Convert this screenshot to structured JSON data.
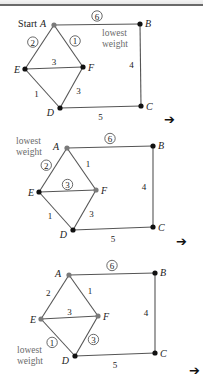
{
  "colors": {
    "edge": "#555555",
    "visited_vertex": "#7a7a7a",
    "unvisited_vertex": "#111111",
    "label_text": "#222222",
    "note_text": "#6a6a6a"
  },
  "panels": [
    {
      "offset_y": 0,
      "note": {
        "line1": "lowest",
        "line2": "weight",
        "x": 102,
        "y": 36
      },
      "start_label": "Start",
      "vertices": {
        "A": {
          "label": "A",
          "x": 54,
          "y": 25,
          "visited": true
        },
        "B": {
          "label": "B",
          "x": 140,
          "y": 24,
          "visited": false
        },
        "C": {
          "label": "C",
          "x": 141,
          "y": 106,
          "visited": false
        },
        "D": {
          "label": "D",
          "x": 60,
          "y": 108,
          "visited": false
        },
        "E": {
          "label": "E",
          "x": 25,
          "y": 69,
          "visited": false
        },
        "F": {
          "label": "F",
          "x": 83,
          "y": 67,
          "visited": false
        }
      },
      "edges": [
        {
          "from": "A",
          "to": "B",
          "weight": "6",
          "circled": true
        },
        {
          "from": "A",
          "to": "E",
          "weight": "2",
          "circled": true
        },
        {
          "from": "A",
          "to": "F",
          "weight": "1",
          "circled": true
        },
        {
          "from": "E",
          "to": "F",
          "weight": "3",
          "circled": false
        },
        {
          "from": "E",
          "to": "D",
          "weight": "1",
          "circled": false
        },
        {
          "from": "F",
          "to": "D",
          "weight": "3",
          "circled": false
        },
        {
          "from": "D",
          "to": "C",
          "weight": "5",
          "circled": false
        },
        {
          "from": "B",
          "to": "C",
          "weight": "4",
          "circled": false
        }
      ],
      "arrow": {
        "glyph": "➔",
        "x": 164,
        "y": 113
      }
    },
    {
      "offset_y": 130,
      "note": {
        "line1": "lowest",
        "line2": "weight",
        "x": 16,
        "y": 14
      },
      "vertices": {
        "A": {
          "label": "A",
          "x": 67,
          "y": 18,
          "visited": true
        },
        "B": {
          "label": "B",
          "x": 153,
          "y": 16,
          "visited": false
        },
        "C": {
          "label": "C",
          "x": 153,
          "y": 97,
          "visited": false
        },
        "D": {
          "label": "D",
          "x": 73,
          "y": 100,
          "visited": false
        },
        "E": {
          "label": "E",
          "x": 39,
          "y": 62,
          "visited": false
        },
        "F": {
          "label": "F",
          "x": 96,
          "y": 60,
          "visited": true
        }
      },
      "edges": [
        {
          "from": "A",
          "to": "B",
          "weight": "6",
          "circled": true
        },
        {
          "from": "A",
          "to": "E",
          "weight": "2",
          "circled": true
        },
        {
          "from": "A",
          "to": "F",
          "weight": "1",
          "circled": false
        },
        {
          "from": "E",
          "to": "F",
          "weight": "3",
          "circled": true
        },
        {
          "from": "E",
          "to": "D",
          "weight": "1",
          "circled": false
        },
        {
          "from": "F",
          "to": "D",
          "weight": "3",
          "circled": false
        },
        {
          "from": "D",
          "to": "C",
          "weight": "5",
          "circled": false
        },
        {
          "from": "B",
          "to": "C",
          "weight": "4",
          "circled": false
        }
      ],
      "arrow": {
        "glyph": "➔",
        "x": 176,
        "y": 235
      }
    },
    {
      "offset_y": 255,
      "note": {
        "line1": "lowest",
        "line2": "weight",
        "x": 17,
        "y": 98
      },
      "vertices": {
        "A": {
          "label": "A",
          "x": 69,
          "y": 20,
          "visited": true
        },
        "B": {
          "label": "B",
          "x": 155,
          "y": 18,
          "visited": false
        },
        "C": {
          "label": "C",
          "x": 155,
          "y": 98,
          "visited": false
        },
        "D": {
          "label": "D",
          "x": 75,
          "y": 101,
          "visited": false
        },
        "E": {
          "label": "E",
          "x": 41,
          "y": 64,
          "visited": true
        },
        "F": {
          "label": "F",
          "x": 98,
          "y": 61,
          "visited": true
        }
      },
      "edges": [
        {
          "from": "A",
          "to": "B",
          "weight": "6",
          "circled": true
        },
        {
          "from": "A",
          "to": "E",
          "weight": "2",
          "circled": false
        },
        {
          "from": "A",
          "to": "F",
          "weight": "1",
          "circled": false
        },
        {
          "from": "E",
          "to": "F",
          "weight": "3",
          "circled": false
        },
        {
          "from": "E",
          "to": "D",
          "weight": "1",
          "circled": true
        },
        {
          "from": "F",
          "to": "D",
          "weight": "3",
          "circled": true
        },
        {
          "from": "D",
          "to": "C",
          "weight": "5",
          "circled": false
        },
        {
          "from": "B",
          "to": "C",
          "weight": "4",
          "circled": false
        }
      ],
      "arrow": {
        "glyph": "➔",
        "x": 189,
        "y": 364
      }
    }
  ]
}
